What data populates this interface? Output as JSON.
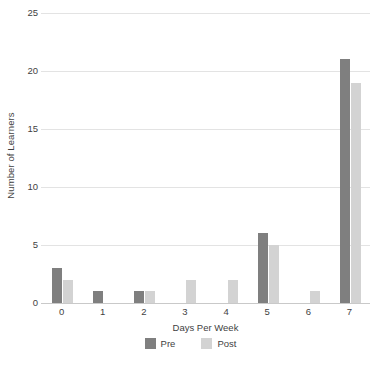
{
  "chart_data": {
    "type": "bar",
    "title": "",
    "subtitle": "",
    "xlabel": "Days Per Week",
    "ylabel": "Number of Learners",
    "categories": [
      "0",
      "1",
      "2",
      "3",
      "4",
      "5",
      "6",
      "7"
    ],
    "series": [
      {
        "name": "Pre",
        "color": "#7f7f7f",
        "values": [
          3,
          1,
          1,
          0,
          0,
          6,
          0,
          21
        ]
      },
      {
        "name": "Post",
        "color": "#d3d3d3",
        "values": [
          2,
          0,
          1,
          2,
          2,
          5,
          1,
          19
        ]
      }
    ],
    "ylim": [
      0,
      25
    ],
    "ytick_labels": [
      "0",
      "5",
      "10",
      "15",
      "20",
      "25"
    ],
    "ytick_values": [
      0,
      5,
      10,
      15,
      20,
      25
    ],
    "grid": true,
    "grid_axis": "y",
    "legend_position": "bottom",
    "bar_grouping": "grouped"
  },
  "legend": {
    "items": [
      {
        "label": "Pre",
        "color": "#7f7f7f"
      },
      {
        "label": "Post",
        "color": "#d3d3d3"
      }
    ]
  },
  "colors": {
    "pre": "#7f7f7f",
    "post": "#d3d3d3",
    "gridline": "#e3e3e3",
    "axis": "#c9c9c9",
    "text": "#3f3f3f",
    "background": "#ffffff"
  }
}
